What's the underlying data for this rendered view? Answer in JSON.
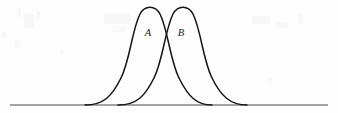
{
  "figure": {
    "background_color": "#fdfdfd",
    "curve_color": "#141414",
    "axis_color": "#4a4a4a",
    "label_color": "#1c1c1c",
    "width": 338,
    "height": 113
  },
  "baseline": {
    "name": "horizontal axis",
    "x_start": 10,
    "x_end": 328,
    "y": 105
  },
  "labels": [
    {
      "text": "A",
      "x": 148,
      "y": 36
    },
    {
      "text": "B",
      "x": 181,
      "y": 36
    }
  ],
  "chart_data": {
    "type": "line",
    "title": "",
    "subtitle": "",
    "xlabel": "",
    "ylabel": "",
    "grid": false,
    "legend": "inline-annotations",
    "xlim": [
      10,
      328
    ],
    "ylim": [
      0,
      1
    ],
    "annotations": [
      {
        "text": "A",
        "x": 148,
        "y": 36,
        "note": "label for left curve"
      },
      {
        "text": "B",
        "x": 181,
        "y": 36,
        "note": "label for right curve"
      }
    ],
    "intersection": {
      "x": 166,
      "y": 20,
      "note": "curves cross here"
    },
    "series": [
      {
        "name": "A",
        "kind": "bell-curve",
        "peak_x": 150,
        "peak_y": 6,
        "left_tail_x": 85,
        "right_tail_x": 212,
        "baseline_y": 105,
        "path": "M 85 105 C 104 105 112 96 121 78 C 130 60 132 30 140 14 C 145 5 155 5 160 14 C 168 30 170 60 179 78 C 188 96 196 105 212 105"
      },
      {
        "name": "B",
        "kind": "bell-curve",
        "peak_x": 183,
        "peak_y": 6,
        "left_tail_x": 118,
        "right_tail_x": 247,
        "baseline_y": 105,
        "path": "M 118 105 C 137 105 145 96 154 78 C 163 60 165 30 173 14 C 178 5 188 5 193 14 C 201 30 203 60 212 78 C 221 96 230 105 247 105"
      }
    ]
  }
}
